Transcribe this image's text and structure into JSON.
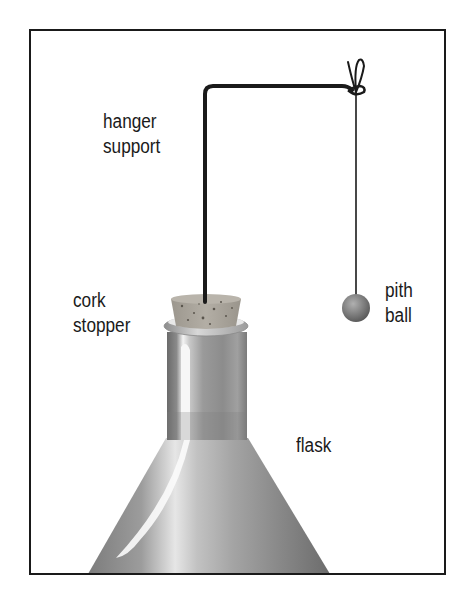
{
  "diagram": {
    "type": "apparatus-illustration",
    "labels": {
      "hanger_support": [
        "hanger",
        "support"
      ],
      "cork_stopper": [
        "cork",
        "stopper"
      ],
      "pith_ball": [
        "pith",
        "ball"
      ],
      "flask": [
        "flask"
      ]
    },
    "colors": {
      "frame": "#1a1a1a",
      "wire": "#1a1a1a",
      "cork": "#a8a39a",
      "glass_dark": "#6f6f6f",
      "glass_light": "#f2f2f2",
      "ball": "#7a7a7a"
    }
  }
}
